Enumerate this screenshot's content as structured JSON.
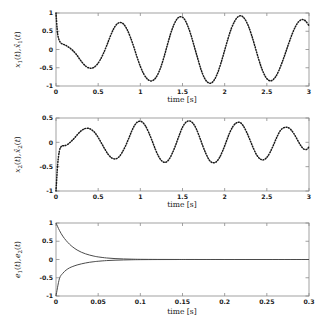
{
  "figure": {
    "background": "#ffffff",
    "axis_color": "#8a8a8a",
    "curve_color": "#1a1a1a",
    "solid_curve_color": "#4a4a4a"
  },
  "chart_data": [
    {
      "type": "line",
      "panel": 1,
      "title": "",
      "xlabel": "time [s]",
      "ylabel": "x1(t), x̂1(t)",
      "ylabel_parts": [
        "x",
        "1",
        "(t), ",
        "x̂",
        "1",
        "(t)"
      ],
      "xlim": [
        0,
        3
      ],
      "ylim": [
        -1,
        1
      ],
      "xticks": [
        0,
        0.5,
        1,
        1.5,
        2,
        2.5,
        3
      ],
      "xticklabels": [
        "0",
        "0.5",
        "1",
        "1.5",
        "2",
        "2.5",
        "3"
      ],
      "yticks": [
        -1,
        -0.5,
        0,
        0.5,
        1
      ],
      "yticklabels": [
        "-1",
        "-0.5",
        "0",
        "0.5",
        "1"
      ],
      "grid": false,
      "legend": "none",
      "linestyle": "dotted",
      "series": [
        {
          "name": "x1(t) and estimate",
          "x": [
            0,
            0.02,
            0.05,
            0.08,
            0.11,
            0.14,
            0.17,
            0.2,
            0.24,
            0.28,
            0.32,
            0.36,
            0.4,
            0.44,
            0.48,
            0.52,
            0.56,
            0.6,
            0.64,
            0.68,
            0.72,
            0.76,
            0.8,
            0.84,
            0.88,
            0.92,
            0.96,
            1.0,
            1.04,
            1.08,
            1.12,
            1.16,
            1.2,
            1.24,
            1.28,
            1.32,
            1.36,
            1.4,
            1.44,
            1.48,
            1.52,
            1.56,
            1.6,
            1.64,
            1.68,
            1.72,
            1.76,
            1.8,
            1.84,
            1.88,
            1.92,
            1.96,
            2.0,
            2.04,
            2.08,
            2.12,
            2.16,
            2.2,
            2.24,
            2.28,
            2.32,
            2.36,
            2.4,
            2.44,
            2.48,
            2.52,
            2.56,
            2.6,
            2.64,
            2.68,
            2.72,
            2.76,
            2.8,
            2.84,
            2.88,
            2.92,
            2.96,
            3.0
          ],
          "y": [
            1.0,
            0.42,
            0.2,
            0.15,
            0.12,
            0.08,
            0.03,
            -0.03,
            -0.13,
            -0.26,
            -0.38,
            -0.47,
            -0.51,
            -0.5,
            -0.43,
            -0.3,
            -0.12,
            0.1,
            0.34,
            0.55,
            0.69,
            0.74,
            0.7,
            0.56,
            0.35,
            0.09,
            -0.2,
            -0.46,
            -0.67,
            -0.8,
            -0.86,
            -0.83,
            -0.71,
            -0.5,
            -0.21,
            0.12,
            0.44,
            0.69,
            0.85,
            0.9,
            0.84,
            0.66,
            0.4,
            0.08,
            -0.24,
            -0.55,
            -0.78,
            -0.9,
            -0.92,
            -0.82,
            -0.62,
            -0.34,
            -0.02,
            0.3,
            0.58,
            0.78,
            0.9,
            0.92,
            0.83,
            0.65,
            0.39,
            0.08,
            -0.24,
            -0.52,
            -0.73,
            -0.84,
            -0.85,
            -0.76,
            -0.59,
            -0.36,
            -0.1,
            0.17,
            0.42,
            0.63,
            0.77,
            0.82,
            0.78,
            0.65
          ]
        }
      ]
    },
    {
      "type": "line",
      "panel": 2,
      "title": "",
      "xlabel": "time [s]",
      "ylabel": "x2(t), x̂2(t)",
      "ylabel_parts": [
        "x",
        "2",
        "(t), ",
        "x̂",
        "2",
        "(t)"
      ],
      "xlim": [
        0,
        3
      ],
      "ylim": [
        -1,
        0.5
      ],
      "xticks": [
        0,
        0.5,
        1,
        1.5,
        2,
        2.5,
        3
      ],
      "xticklabels": [
        "0",
        "0.5",
        "1",
        "1.5",
        "2",
        "2.5",
        "3"
      ],
      "yticks": [
        -1,
        -0.5,
        0,
        0.5
      ],
      "yticklabels": [
        "-1",
        "-0.5",
        "0",
        "0.5"
      ],
      "grid": false,
      "legend": "none",
      "linestyle": "dotted",
      "series": [
        {
          "name": "x2(t) and estimate",
          "x": [
            0,
            0.02,
            0.04,
            0.06,
            0.08,
            0.1,
            0.14,
            0.18,
            0.22,
            0.26,
            0.3,
            0.34,
            0.38,
            0.42,
            0.46,
            0.5,
            0.54,
            0.58,
            0.62,
            0.66,
            0.7,
            0.74,
            0.78,
            0.82,
            0.86,
            0.9,
            0.94,
            0.98,
            1.02,
            1.06,
            1.1,
            1.14,
            1.18,
            1.22,
            1.26,
            1.3,
            1.34,
            1.38,
            1.42,
            1.46,
            1.5,
            1.54,
            1.58,
            1.62,
            1.66,
            1.7,
            1.74,
            1.78,
            1.82,
            1.86,
            1.9,
            1.94,
            1.98,
            2.02,
            2.06,
            2.1,
            2.14,
            2.18,
            2.22,
            2.26,
            2.3,
            2.34,
            2.38,
            2.42,
            2.46,
            2.5,
            2.54,
            2.58,
            2.62,
            2.66,
            2.7,
            2.74,
            2.78,
            2.82,
            2.86,
            2.9,
            2.94,
            2.98,
            3.0
          ],
          "y": [
            -1.0,
            -0.45,
            -0.18,
            -0.09,
            -0.07,
            -0.07,
            -0.04,
            0.02,
            0.09,
            0.17,
            0.24,
            0.28,
            0.29,
            0.26,
            0.2,
            0.1,
            -0.02,
            -0.14,
            -0.25,
            -0.32,
            -0.34,
            -0.31,
            -0.22,
            -0.09,
            0.07,
            0.24,
            0.37,
            0.43,
            0.42,
            0.34,
            0.2,
            0.03,
            -0.15,
            -0.3,
            -0.39,
            -0.41,
            -0.35,
            -0.22,
            -0.05,
            0.14,
            0.31,
            0.41,
            0.44,
            0.4,
            0.29,
            0.12,
            -0.07,
            -0.24,
            -0.37,
            -0.42,
            -0.4,
            -0.31,
            -0.16,
            0.02,
            0.2,
            0.33,
            0.4,
            0.41,
            0.34,
            0.21,
            0.05,
            -0.12,
            -0.26,
            -0.34,
            -0.36,
            -0.31,
            -0.2,
            -0.05,
            0.11,
            0.24,
            0.3,
            0.31,
            0.27,
            0.18,
            0.06,
            -0.06,
            -0.14,
            -0.14,
            -0.08
          ]
        }
      ]
    },
    {
      "type": "line",
      "panel": 3,
      "title": "",
      "xlabel": "time [s]",
      "ylabel": "e1(t), e2(t)",
      "ylabel_parts": [
        "e",
        "1",
        "(t), ",
        "e",
        "2",
        "(t)"
      ],
      "xlim": [
        0,
        0.3
      ],
      "ylim": [
        -1,
        1
      ],
      "xticks": [
        0,
        0.05,
        0.1,
        0.15,
        0.2,
        0.25,
        0.3
      ],
      "xticklabels": [
        "0",
        "0.05",
        "0.1",
        "0.15",
        "0.2",
        "0.25",
        "0.3"
      ],
      "yticks": [
        -1,
        -0.5,
        0,
        0.5,
        1
      ],
      "yticklabels": [
        "-1",
        "-0.5",
        "0",
        "0.5",
        "1"
      ],
      "grid": false,
      "legend": "none",
      "linestyle": "solid",
      "series": [
        {
          "name": "e1(t)",
          "x": [
            0,
            0.004,
            0.008,
            0.012,
            0.016,
            0.02,
            0.025,
            0.03,
            0.035,
            0.04,
            0.045,
            0.05,
            0.06,
            0.07,
            0.08,
            0.09,
            0.1,
            0.12,
            0.14,
            0.16,
            0.2,
            0.25,
            0.3
          ],
          "y": [
            1.0,
            0.8,
            0.64,
            0.52,
            0.42,
            0.34,
            0.26,
            0.2,
            0.155,
            0.12,
            0.092,
            0.071,
            0.042,
            0.025,
            0.015,
            0.009,
            0.005,
            0.002,
            0.001,
            0.0005,
            0.0,
            0.0,
            0.0
          ]
        },
        {
          "name": "e2(t)",
          "x": [
            0,
            0.004,
            0.008,
            0.012,
            0.016,
            0.02,
            0.025,
            0.03,
            0.035,
            0.04,
            0.045,
            0.05,
            0.06,
            0.07,
            0.08,
            0.09,
            0.1,
            0.12,
            0.14,
            0.16,
            0.2,
            0.25,
            0.3
          ],
          "y": [
            -1.0,
            -0.53,
            -0.38,
            -0.29,
            -0.23,
            -0.19,
            -0.15,
            -0.12,
            -0.095,
            -0.075,
            -0.06,
            -0.048,
            -0.03,
            -0.019,
            -0.012,
            -0.007,
            -0.004,
            -0.0015,
            -0.0006,
            -0.0003,
            0.0,
            0.0,
            0.0
          ]
        }
      ]
    }
  ]
}
